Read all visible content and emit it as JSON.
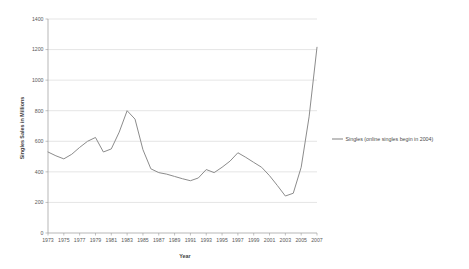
{
  "chart_data": {
    "type": "line",
    "title": "",
    "xlabel": "Year",
    "ylabel": "Singles Sales in Millions",
    "xlim": [
      1973,
      2007
    ],
    "ylim": [
      0,
      1400
    ],
    "grid": true,
    "legend_position": "right",
    "y_ticks": [
      0,
      200,
      400,
      600,
      800,
      1000,
      1200,
      1400
    ],
    "x_ticks": [
      1973,
      1975,
      1977,
      1979,
      1981,
      1983,
      1985,
      1987,
      1989,
      1991,
      1993,
      1995,
      1997,
      1999,
      2001,
      2003,
      2005,
      2007
    ],
    "x": [
      1973,
      1974,
      1975,
      1976,
      1977,
      1978,
      1979,
      1980,
      1981,
      1982,
      1983,
      1984,
      1985,
      1986,
      1987,
      1988,
      1989,
      1990,
      1991,
      1992,
      1993,
      1994,
      1995,
      1996,
      1997,
      1998,
      1999,
      2000,
      2001,
      2002,
      2003,
      2004,
      2005,
      2006,
      2007
    ],
    "series": [
      {
        "name": "Singles (online singles begin in 2004)",
        "color": "#8c8c8c",
        "values": [
          530,
          505,
          485,
          515,
          560,
          600,
          625,
          530,
          550,
          660,
          800,
          745,
          545,
          420,
          395,
          385,
          370,
          355,
          342,
          360,
          415,
          395,
          430,
          470,
          525,
          495,
          462,
          430,
          375,
          310,
          242,
          260,
          430,
          760,
          1215
        ]
      }
    ]
  },
  "legend": {
    "entries": [
      {
        "label": "Singles (online singles begin in 2004)",
        "color": "#8c8c8c"
      }
    ]
  },
  "axes": {
    "x_title": "Year",
    "y_title": "Singles Sales in Millions"
  }
}
